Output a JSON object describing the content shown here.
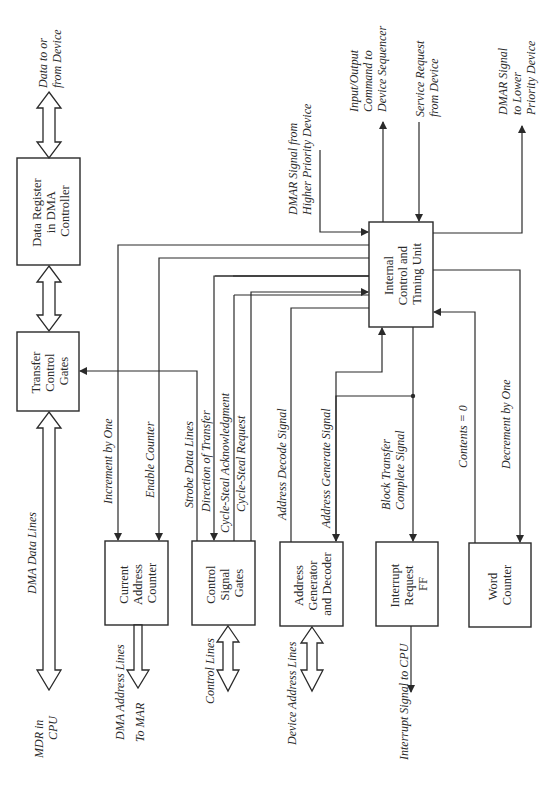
{
  "diagram": {
    "orientation": "rotated 90 degrees counter-clockwise",
    "colors": {
      "line": "#2a2a2a",
      "background": "#ffffff"
    },
    "blocks": {
      "data_register": {
        "lines": [
          "Data Register",
          "in DMA",
          "Controller"
        ]
      },
      "transfer_control_gates": {
        "lines": [
          "Transfer",
          "Control",
          "Gates"
        ]
      },
      "internal_control": {
        "lines": [
          "Internal",
          "Control and",
          "Timing Unit"
        ]
      },
      "current_address_counter": {
        "lines": [
          "Current",
          "Address",
          "Counter"
        ]
      },
      "control_signal_gates": {
        "lines": [
          "Control",
          "Signal",
          "Gates"
        ]
      },
      "address_generator": {
        "lines": [
          "Address",
          "Generator",
          "and Decoder"
        ]
      },
      "interrupt_request": {
        "lines": [
          "Interrupt",
          "Request",
          "FF"
        ]
      },
      "word_counter": {
        "lines": [
          "Word",
          "Counter"
        ]
      }
    },
    "signals": {
      "data_to_from_device": {
        "lines": [
          "Data to or",
          "from Device"
        ]
      },
      "dma_data_lines": "DMA Data Lines",
      "mdr_in_cpu": {
        "lines": [
          "MDR in",
          "CPU"
        ]
      },
      "dma_address_lines": "DMA Address Lines",
      "to_mar": "To MAR",
      "control_lines": "Control Lines",
      "device_address_lines": "Device Address Lines",
      "interrupt_signal_to_cpu": "Interrupt Signal to CPU",
      "increment_by_one": "Increment by One",
      "enable_counter": "Enable Counter",
      "strobe_data_lines": "Strobe Data Lines",
      "direction_of_transfer": "Direction of Transfer",
      "cycle_steal_ack": "Cycle-Steal Acknowledgment",
      "cycle_steal_request": "Cycle-Steal Request",
      "address_decode_signal": "Address Decode Signal",
      "address_generate_signal": "Address Generate Signal",
      "block_transfer_complete": {
        "lines": [
          "Block Transfer",
          "Complete Signal"
        ]
      },
      "contents_zero": "Contents = 0",
      "decrement_by_one": "Decrement by One",
      "dmar_from_higher": {
        "lines": [
          "DMAR Signal from",
          "Higher Priority Device"
        ]
      },
      "io_command": {
        "lines": [
          "Input/Output",
          "Command to",
          "Device Sequencer"
        ]
      },
      "service_request": {
        "lines": [
          "Service Request",
          "from Device"
        ]
      },
      "dmar_to_lower": {
        "lines": [
          "DMAR Signal",
          "to Lower",
          "Priority Device"
        ]
      }
    }
  }
}
